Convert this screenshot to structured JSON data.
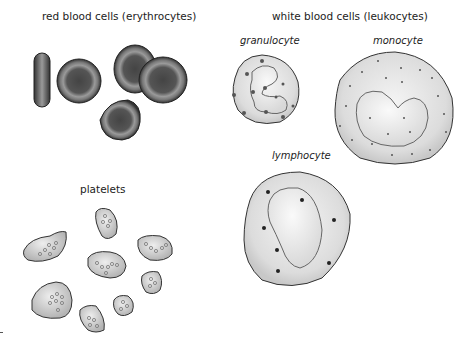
{
  "sections": {
    "red": {
      "title": "red blood cells (erythrocytes)"
    },
    "white": {
      "title": "white blood cells (leukocytes)",
      "types": {
        "granulocyte": "granulocyte",
        "monocyte": "monocyte",
        "lymphocyte": "lymphocyte"
      }
    },
    "platelets": {
      "title": "platelets"
    }
  },
  "colors": {
    "rbc_outer": "#3a3a3a",
    "rbc_rim": "#9a9a9a",
    "rbc_core": "#4a4a4a",
    "wbc_fill": "#e6e6e6",
    "nucleus_fill": "#f2f2f2",
    "platelet_fill": "#c8c8c8",
    "outline": "#333333"
  }
}
